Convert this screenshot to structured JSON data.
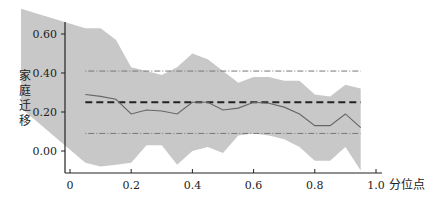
{
  "chart_data": {
    "type": "line",
    "title": "",
    "xlabel": "分位点",
    "ylabel": "家庭迁移",
    "xlim": [
      0,
      1.0
    ],
    "ylim": [
      -0.1,
      0.7
    ],
    "grid": false,
    "legend": null,
    "x_ticks": [
      "0",
      "0.2",
      "0.4",
      "0.6",
      "0.8",
      "1.0"
    ],
    "y_ticks": [
      "0.00",
      "0.20",
      "0.40",
      "0.60"
    ],
    "x": [
      0.05,
      0.1,
      0.15,
      0.2,
      0.25,
      0.3,
      0.35,
      0.4,
      0.45,
      0.5,
      0.55,
      0.6,
      0.65,
      0.7,
      0.75,
      0.8,
      0.85,
      0.9,
      0.95
    ],
    "series": [
      {
        "name": "quantile regression coefficient",
        "style": "solid",
        "values": [
          0.29,
          0.28,
          0.265,
          0.19,
          0.21,
          0.205,
          0.19,
          0.25,
          0.25,
          0.21,
          0.22,
          0.25,
          0.245,
          0.225,
          0.19,
          0.13,
          0.13,
          0.19,
          0.12
        ]
      },
      {
        "name": "confidence band upper",
        "style": "band",
        "values": [
          0.63,
          0.63,
          0.57,
          0.43,
          0.41,
          0.39,
          0.43,
          0.5,
          0.47,
          0.41,
          0.35,
          0.38,
          0.38,
          0.36,
          0.36,
          0.29,
          0.28,
          0.34,
          0.32
        ]
      },
      {
        "name": "confidence band lower",
        "style": "band",
        "values": [
          -0.06,
          -0.08,
          -0.07,
          -0.06,
          0.03,
          0.03,
          -0.07,
          0.0,
          0.02,
          -0.01,
          0.08,
          0.09,
          0.08,
          0.06,
          0.02,
          -0.05,
          -0.05,
          0.02,
          -0.1
        ]
      },
      {
        "name": "OLS estimate",
        "style": "dashed",
        "value": 0.25
      },
      {
        "name": "OLS CI upper",
        "style": "dotted",
        "value": 0.41
      },
      {
        "name": "OLS CI lower",
        "style": "dotted",
        "value": 0.09
      }
    ],
    "band_start": {
      "x": -0.16,
      "upper": 0.73,
      "lower": 0.22
    },
    "colors": {
      "band": "#c8c8c8",
      "line": "#666666",
      "ols": "#222222",
      "ci": "#777777",
      "axis": "#222222"
    }
  },
  "labels": {
    "xlabel": "分位点",
    "ylabel_chars": [
      "家",
      "庭",
      "迁",
      "移"
    ],
    "x_ticks": [
      "0",
      "0.2",
      "0.4",
      "0.6",
      "0.8",
      "1.0"
    ],
    "y_ticks": [
      "0.00",
      "0.20",
      "0.40",
      "0.60"
    ]
  }
}
